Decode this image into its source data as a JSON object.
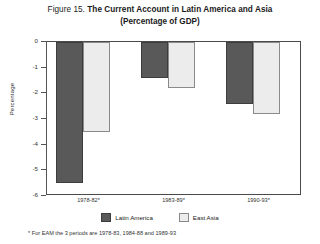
{
  "figure": {
    "title_prefix": "Figure 15.",
    "title_main": "The Current Account in Latin America and Asia",
    "subtitle": "(Percentage of GDP)",
    "footnote": "* For EAM the 3 periods are 1978-83, 1984-88 and 1989-93"
  },
  "legend": {
    "items": [
      {
        "label": "Latin America",
        "color": "#595959",
        "swatch": "latin-america-swatch"
      },
      {
        "label": "East Asia",
        "color": "#ececec",
        "swatch": "east-asia-swatch"
      }
    ]
  },
  "axis": {
    "y_title": "Percentage",
    "y_ticks": [
      "0",
      "-1",
      "-2",
      "-3",
      "-4",
      "-5",
      "-6"
    ]
  },
  "chart_data": {
    "type": "bar",
    "title": "Figure 15. The Current Account in Latin America and Asia (Percentage of GDP)",
    "subtitle": "(Percentage of GDP)",
    "categories": [
      "1978-82*",
      "1983-89*",
      "1990-93*"
    ],
    "series": [
      {
        "name": "Latin America",
        "color": "#595959",
        "values": [
          -5.5,
          -1.4,
          -2.4
        ]
      },
      {
        "name": "East Asia",
        "color": "#ececec",
        "values": [
          -3.5,
          -1.8,
          -2.8
        ]
      }
    ],
    "xlabel": "",
    "ylabel": "Percentage",
    "ylim": [
      -6,
      0
    ],
    "ytick_step": 1,
    "grid": false,
    "legend_position": "bottom",
    "annotations": [
      "* For EAM the 3 periods are 1978-83, 1984-88 and 1989-93"
    ]
  }
}
